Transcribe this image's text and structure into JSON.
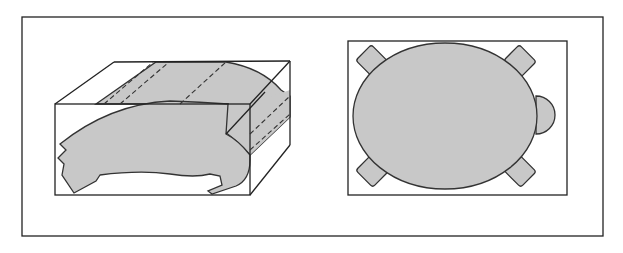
{
  "figure": {
    "panels": [
      {
        "name": "oblique-view",
        "label": ""
      },
      {
        "name": "top-view",
        "label": ""
      }
    ],
    "colors": {
      "fill": "#c8c8c8",
      "stroke": "#222222",
      "background": "#ffffff"
    }
  }
}
